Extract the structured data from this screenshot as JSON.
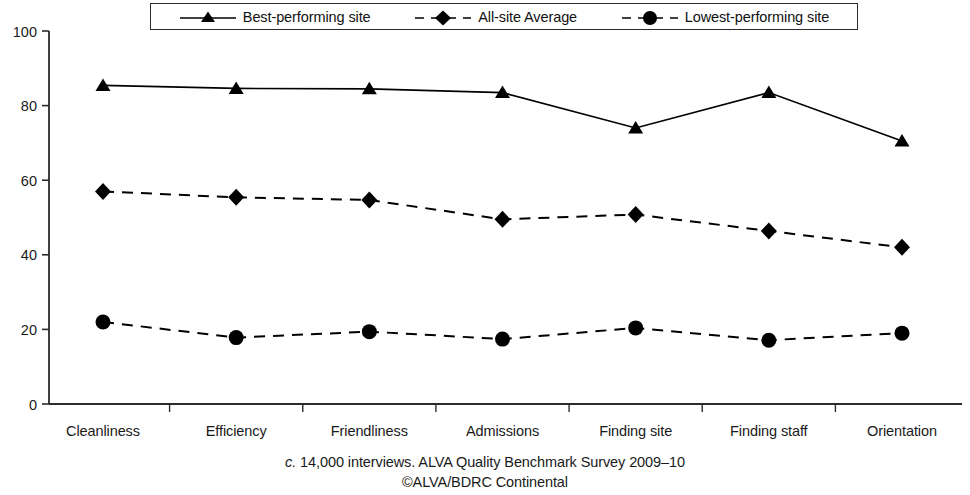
{
  "chart_data": {
    "type": "line",
    "title": "",
    "xlabel": "",
    "ylabel": "",
    "ylim": [
      0,
      100
    ],
    "yticks": [
      0,
      20,
      40,
      60,
      80,
      100
    ],
    "grid": false,
    "legend_position": "top",
    "categories": [
      "Cleanliness",
      "Efficiency",
      "Friendliness",
      "Admissions",
      "Finding site",
      "Finding staff",
      "Orientation"
    ],
    "series": [
      {
        "name": "Best-performing site",
        "marker": "triangle",
        "linestyle": "solid",
        "color": "#000000",
        "values": [
          85.4,
          84.6,
          84.5,
          83.5,
          74.0,
          83.5,
          70.5
        ]
      },
      {
        "name": "All-site Average",
        "marker": "diamond",
        "linestyle": "dashed",
        "color": "#000000",
        "values": [
          57.0,
          55.4,
          54.7,
          49.5,
          50.8,
          46.4,
          42.0
        ]
      },
      {
        "name": "Lowest-performing site",
        "marker": "circle",
        "linestyle": "dashed",
        "color": "#000000",
        "values": [
          22.0,
          17.8,
          19.4,
          17.4,
          20.4,
          17.1,
          19.0
        ]
      }
    ],
    "annotations": [
      "c. 14,000 interviews. ALVA Quality Benchmark Survey 2009–10",
      "©ALVA/BDRC Continental"
    ]
  },
  "legend": {
    "items": [
      {
        "label": "Best-performing site"
      },
      {
        "label": "All-site Average"
      },
      {
        "label": "Lowest-performing site"
      }
    ]
  },
  "caption": {
    "prefix": "c.",
    "line1_rest": " 14,000 interviews. ALVA Quality Benchmark Survey 2009–10",
    "line2": "©ALVA/BDRC Continental"
  }
}
